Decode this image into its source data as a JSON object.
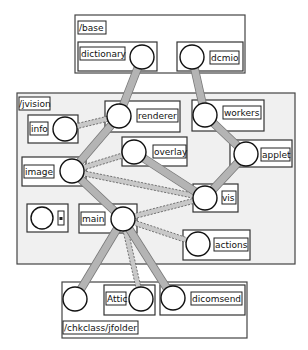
{
  "diagram": {
    "type": "package-dependency-graph",
    "packages": [
      {
        "id": "base",
        "label": "/base",
        "nodes": [
          {
            "id": "dictionary",
            "label": "dictionary"
          },
          {
            "id": "dcmio",
            "label": "dcmio"
          }
        ]
      },
      {
        "id": "jvision",
        "label": "/jvision",
        "nodes": [
          {
            "id": "info",
            "label": "info"
          },
          {
            "id": "renderer",
            "label": "renderer"
          },
          {
            "id": "workers",
            "label": "workers"
          },
          {
            "id": "image",
            "label": "image"
          },
          {
            "id": "overlay",
            "label": "overlay"
          },
          {
            "id": "applet",
            "label": "applet"
          },
          {
            "id": "vis",
            "label": "vis"
          },
          {
            "id": "unnamed",
            "label": "⊞"
          },
          {
            "id": "main",
            "label": "main"
          },
          {
            "id": "actions",
            "label": "actions"
          }
        ]
      },
      {
        "id": "chkclass",
        "label": "/chkclass/jfolder",
        "nodes": [
          {
            "id": "jfolder-root",
            "label": ""
          },
          {
            "id": "attic",
            "label": "Attic"
          },
          {
            "id": "dicomsend",
            "label": "dicomsend"
          }
        ]
      }
    ],
    "edges": [
      {
        "from": "renderer",
        "to": "dictionary",
        "style": "solid"
      },
      {
        "from": "workers",
        "to": "dcmio",
        "style": "solid"
      },
      {
        "from": "info",
        "to": "renderer",
        "style": "dashed"
      },
      {
        "from": "image",
        "to": "renderer",
        "style": "solid"
      },
      {
        "from": "image",
        "to": "overlay",
        "style": "dashed"
      },
      {
        "from": "image",
        "to": "vis",
        "style": "dashed"
      },
      {
        "from": "image",
        "to": "main",
        "style": "solid"
      },
      {
        "from": "overlay",
        "to": "vis",
        "style": "solid"
      },
      {
        "from": "workers",
        "to": "applet",
        "style": "solid"
      },
      {
        "from": "applet",
        "to": "vis",
        "style": "solid"
      },
      {
        "from": "main",
        "to": "vis",
        "style": "dashed"
      },
      {
        "from": "main",
        "to": "actions",
        "style": "dashed"
      },
      {
        "from": "main",
        "to": "jfolder-root",
        "style": "solid"
      },
      {
        "from": "main",
        "to": "attic",
        "style": "dashed"
      },
      {
        "from": "main",
        "to": "dicomsend",
        "style": "solid"
      }
    ]
  }
}
